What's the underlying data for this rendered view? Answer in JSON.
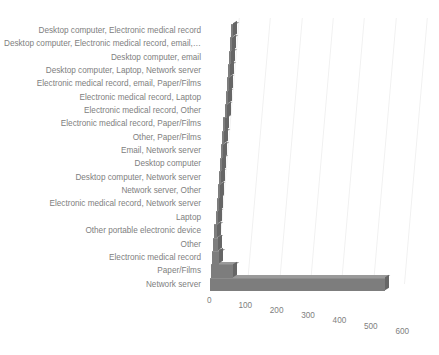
{
  "chart_data": {
    "type": "bar",
    "orientation": "horizontal",
    "title": "",
    "xlabel": "",
    "ylabel": "",
    "xlim": [
      0,
      600
    ],
    "xticks": [
      0,
      100,
      200,
      300,
      400,
      500,
      600
    ],
    "grid": true,
    "legend": false,
    "style": "3d-perspective",
    "bar_color": "#7d7d7d",
    "categories": [
      "Desktop computer, Electronic medical record",
      "Desktop computer, Electronic medical record, email,…",
      "Desktop computer, email",
      "Desktop computer, Laptop, Network server",
      "Electronic medical record, email, Paper/Films",
      "Electronic medical record, Laptop",
      "Electronic medical record, Other",
      "Electronic medical record, Paper/Films",
      "Other, Paper/Films",
      "Email, Network server",
      "Desktop computer",
      "Desktop computer, Network server",
      "Network server, Other",
      "Electronic medical record, Network server",
      "Laptop",
      "Other portable electronic device",
      "Other",
      "Electronic medical record",
      "Paper/Films",
      "Network server"
    ],
    "values": [
      1,
      1,
      1,
      1,
      1,
      1,
      1,
      1,
      1,
      1,
      2,
      2,
      2,
      3,
      5,
      8,
      14,
      22,
      70,
      560
    ]
  },
  "axis": {
    "tick_labels": [
      "0",
      "100",
      "200",
      "300",
      "400",
      "500",
      "600"
    ]
  }
}
